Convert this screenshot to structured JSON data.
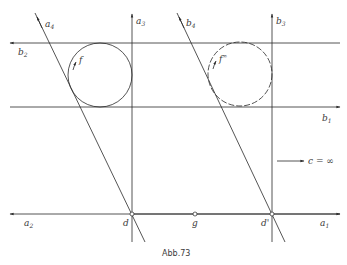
{
  "caption": "Abb.73",
  "labels": {
    "a4": {
      "base": "a",
      "sub": "4"
    },
    "b2_top": {
      "base": "b",
      "sub": "2"
    },
    "a3": {
      "base": "a",
      "sub": "3"
    },
    "f": {
      "base": "f",
      "sup": ""
    },
    "b4": {
      "base": "b",
      "sub": "4"
    },
    "b3": {
      "base": "b",
      "sub": "3"
    },
    "f_infty": {
      "base": "f",
      "sup": "∞"
    },
    "b1": {
      "base": "b",
      "sub": "1"
    },
    "c_infty": "c = ∞",
    "a2": {
      "base": "a",
      "sub": "2"
    },
    "d": "d",
    "g": "g",
    "d_prime": "d'",
    "a1": {
      "base": "a",
      "sub": "1"
    }
  },
  "colors": {
    "line": "#2a2a2a",
    "text": "#3a3a3a",
    "background": "#ffffff"
  }
}
